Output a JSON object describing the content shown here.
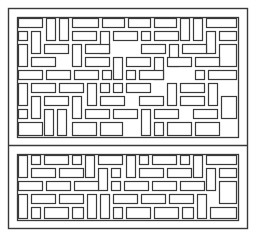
{
  "drawing": {
    "title": "Lattice screen panel line drawing",
    "stroke_color": "#3a3a3a",
    "background": "#ffffff",
    "outer_frame": {
      "x": 8,
      "y": 8,
      "w": 239,
      "h": 220
    },
    "divider_y": 145,
    "upper_panel": {
      "x": 17,
      "y": 17,
      "w": 221,
      "h": 120
    },
    "lower_panel": {
      "x": 17,
      "y": 154,
      "w": 221,
      "h": 66
    },
    "upper_bricks": [
      [
        18,
        18,
        24,
        9
      ],
      [
        46,
        18,
        9,
        22
      ],
      [
        59,
        18,
        9,
        22
      ],
      [
        72,
        18,
        26,
        9
      ],
      [
        102,
        18,
        22,
        9
      ],
      [
        128,
        18,
        22,
        9
      ],
      [
        154,
        18,
        22,
        9
      ],
      [
        180,
        18,
        9,
        22
      ],
      [
        193,
        18,
        9,
        22
      ],
      [
        206,
        18,
        30,
        9
      ],
      [
        18,
        31,
        9,
        9
      ],
      [
        31,
        31,
        9,
        22
      ],
      [
        72,
        31,
        24,
        9
      ],
      [
        100,
        31,
        9,
        22
      ],
      [
        113,
        31,
        24,
        9
      ],
      [
        141,
        31,
        9,
        9
      ],
      [
        154,
        31,
        24,
        9
      ],
      [
        206,
        31,
        9,
        22
      ],
      [
        219,
        31,
        17,
        9
      ],
      [
        18,
        44,
        9,
        22
      ],
      [
        44,
        44,
        24,
        9
      ],
      [
        72,
        44,
        9,
        22
      ],
      [
        85,
        44,
        24,
        9
      ],
      [
        141,
        44,
        24,
        9
      ],
      [
        169,
        44,
        9,
        22
      ],
      [
        182,
        44,
        24,
        9
      ],
      [
        219,
        44,
        17,
        22
      ],
      [
        31,
        57,
        24,
        9
      ],
      [
        85,
        57,
        24,
        9
      ],
      [
        113,
        57,
        9,
        22
      ],
      [
        126,
        57,
        24,
        9
      ],
      [
        154,
        57,
        9,
        22
      ],
      [
        167,
        57,
        24,
        9
      ],
      [
        195,
        57,
        24,
        9
      ],
      [
        18,
        70,
        24,
        9
      ],
      [
        46,
        70,
        24,
        9
      ],
      [
        74,
        70,
        24,
        9
      ],
      [
        102,
        70,
        9,
        9
      ],
      [
        126,
        70,
        9,
        9
      ],
      [
        139,
        70,
        24,
        9
      ],
      [
        195,
        70,
        9,
        9
      ],
      [
        208,
        70,
        28,
        9
      ],
      [
        18,
        83,
        9,
        22
      ],
      [
        31,
        83,
        24,
        9
      ],
      [
        59,
        83,
        24,
        9
      ],
      [
        87,
        83,
        9,
        22
      ],
      [
        100,
        83,
        9,
        9
      ],
      [
        113,
        83,
        9,
        9
      ],
      [
        126,
        83,
        24,
        9
      ],
      [
        167,
        83,
        9,
        22
      ],
      [
        180,
        83,
        24,
        9
      ],
      [
        208,
        83,
        9,
        22
      ],
      [
        31,
        96,
        9,
        22
      ],
      [
        44,
        96,
        24,
        9
      ],
      [
        72,
        96,
        9,
        22
      ],
      [
        100,
        96,
        24,
        9
      ],
      [
        139,
        96,
        24,
        9
      ],
      [
        180,
        96,
        24,
        9
      ],
      [
        221,
        96,
        15,
        22
      ],
      [
        18,
        109,
        9,
        9
      ],
      [
        44,
        109,
        9,
        26
      ],
      [
        57,
        109,
        9,
        26
      ],
      [
        85,
        109,
        24,
        9
      ],
      [
        113,
        109,
        24,
        9
      ],
      [
        141,
        109,
        9,
        26
      ],
      [
        154,
        109,
        24,
        9
      ],
      [
        193,
        109,
        24,
        9
      ],
      [
        18,
        122,
        24,
        13
      ],
      [
        72,
        122,
        24,
        13
      ],
      [
        100,
        122,
        22,
        13
      ],
      [
        154,
        122,
        9,
        13
      ],
      [
        167,
        122,
        24,
        13
      ],
      [
        195,
        122,
        24,
        13
      ]
    ],
    "lower_bricks": [
      [
        18,
        155,
        9,
        22
      ],
      [
        31,
        155,
        9,
        9
      ],
      [
        44,
        155,
        24,
        9
      ],
      [
        72,
        155,
        9,
        9
      ],
      [
        85,
        155,
        9,
        22
      ],
      [
        98,
        155,
        24,
        9
      ],
      [
        126,
        155,
        9,
        22
      ],
      [
        139,
        155,
        9,
        9
      ],
      [
        152,
        155,
        24,
        9
      ],
      [
        180,
        155,
        9,
        9
      ],
      [
        193,
        155,
        9,
        22
      ],
      [
        206,
        155,
        30,
        9
      ],
      [
        31,
        168,
        24,
        9
      ],
      [
        59,
        168,
        24,
        9
      ],
      [
        98,
        168,
        9,
        22
      ],
      [
        111,
        168,
        9,
        9
      ],
      [
        139,
        168,
        24,
        9
      ],
      [
        167,
        168,
        24,
        9
      ],
      [
        206,
        168,
        9,
        22
      ],
      [
        219,
        168,
        17,
        9
      ],
      [
        18,
        181,
        24,
        9
      ],
      [
        46,
        181,
        24,
        9
      ],
      [
        74,
        181,
        24,
        9
      ],
      [
        111,
        181,
        9,
        9
      ],
      [
        124,
        181,
        24,
        9
      ],
      [
        152,
        181,
        24,
        9
      ],
      [
        180,
        181,
        24,
        9
      ],
      [
        219,
        181,
        17,
        22
      ],
      [
        18,
        194,
        9,
        24
      ],
      [
        31,
        194,
        24,
        9
      ],
      [
        59,
        194,
        24,
        9
      ],
      [
        87,
        194,
        9,
        24
      ],
      [
        100,
        194,
        9,
        24
      ],
      [
        113,
        194,
        24,
        9
      ],
      [
        141,
        194,
        24,
        9
      ],
      [
        169,
        194,
        24,
        9
      ],
      [
        197,
        194,
        9,
        24
      ],
      [
        31,
        207,
        9,
        11
      ],
      [
        44,
        207,
        24,
        11
      ],
      [
        72,
        207,
        11,
        11
      ],
      [
        113,
        207,
        9,
        11
      ],
      [
        126,
        207,
        24,
        11
      ],
      [
        154,
        207,
        24,
        11
      ],
      [
        182,
        207,
        11,
        11
      ],
      [
        210,
        207,
        26,
        11
      ]
    ]
  }
}
